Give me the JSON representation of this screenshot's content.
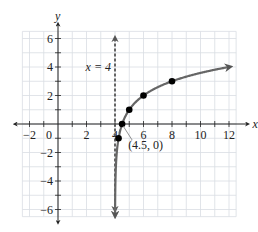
{
  "chart_data": {
    "type": "line",
    "title": "",
    "xlabel": "x",
    "ylabel": "y",
    "xlim": [
      -2.5,
      12.5
    ],
    "ylim": [
      -6.5,
      6.5
    ],
    "grid": true,
    "x_ticks": [
      -2,
      0,
      2,
      4,
      6,
      8,
      10,
      12
    ],
    "x_tick_labels": [
      "−2",
      "0",
      "2",
      "4",
      "6",
      "8",
      "10",
      "12"
    ],
    "y_ticks": [
      -6,
      -4,
      -2,
      2,
      4,
      6
    ],
    "y_tick_labels": [
      "−6",
      "−4",
      "−2",
      "2",
      "4",
      "6"
    ],
    "function": "y = log2(2(x - 4))",
    "series": [
      {
        "name": "curve",
        "x_range": [
          4.01,
          12
        ],
        "points": [
          {
            "x": 4.25,
            "y": -1
          },
          {
            "x": 4.5,
            "y": 0
          },
          {
            "x": 5,
            "y": 1
          },
          {
            "x": 6,
            "y": 2
          },
          {
            "x": 8,
            "y": 3
          }
        ],
        "color": "#666666"
      }
    ],
    "asymptote": {
      "x": 4,
      "label": "x = 4",
      "color": "#555555"
    },
    "annotations": [
      {
        "text": "(4.5, 0)",
        "point": {
          "x": 4.5,
          "y": 0
        }
      }
    ]
  }
}
